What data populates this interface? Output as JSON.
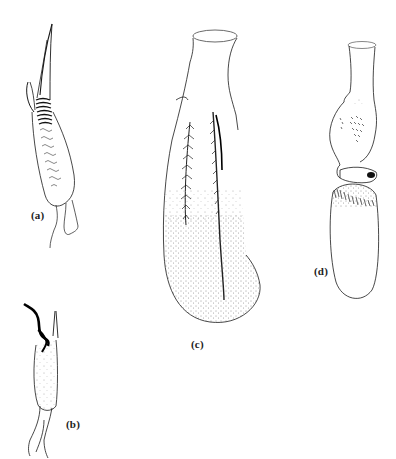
{
  "figure": {
    "background": "#ffffff",
    "ink_color": "#1a1a1a",
    "panels": [
      {
        "id": "a",
        "label": "(a)",
        "description": "elongated organ with spiked apical projections and banded ridges"
      },
      {
        "id": "b",
        "label": "(b)",
        "description": "small cylindrical organ with dark curled apical structure"
      },
      {
        "id": "c",
        "label": "(c)",
        "description": "large flask-shaped organ with two feathered bands and stippled base"
      },
      {
        "id": "d",
        "label": "(d)",
        "description": "constricted organ with scattered spines, dark sclerite and oval stippled-band lower bulb"
      }
    ]
  }
}
